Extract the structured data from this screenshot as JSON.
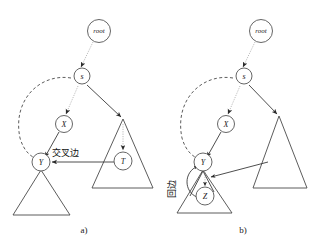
{
  "figure": {
    "background": "#ffffff",
    "panels": [
      {
        "id": "a",
        "caption": "a)",
        "nodes": [
          {
            "id": "root",
            "label": "root"
          },
          {
            "id": "s",
            "label": "s"
          },
          {
            "id": "X",
            "label": "X"
          },
          {
            "id": "Y",
            "label": "Y"
          },
          {
            "id": "T",
            "label": "T"
          }
        ],
        "annotations": [
          {
            "id": "cross-edge-label",
            "text": "交叉边",
            "meaning": "cross edge"
          }
        ],
        "edges": [
          {
            "from": "root",
            "to": "s",
            "style": "dotted"
          },
          {
            "from": "s",
            "to": "X",
            "style": "dotted"
          },
          {
            "from": "s",
            "to": "T-triangle",
            "style": "solid"
          },
          {
            "from": "X",
            "to": "Y",
            "style": "solid"
          },
          {
            "from": "s",
            "to": "Y",
            "style": "dashed"
          },
          {
            "from": "T",
            "to": "Y",
            "style": "solid"
          },
          {
            "from": "T-triangle-apex",
            "to": "T",
            "style": "dotted"
          }
        ]
      },
      {
        "id": "b",
        "caption": "b)",
        "nodes": [
          {
            "id": "root",
            "label": "root"
          },
          {
            "id": "s",
            "label": "s"
          },
          {
            "id": "X",
            "label": "X"
          },
          {
            "id": "Y",
            "label": "Y"
          },
          {
            "id": "Z",
            "label": "Z"
          }
        ],
        "annotations": [
          {
            "id": "back-edge-label",
            "text": "回边",
            "meaning": "back edge"
          }
        ],
        "edges": [
          {
            "from": "root",
            "to": "s",
            "style": "dotted"
          },
          {
            "from": "s",
            "to": "X",
            "style": "dotted"
          },
          {
            "from": "s",
            "to": "right-triangle",
            "style": "solid"
          },
          {
            "from": "X",
            "to": "Y",
            "style": "solid"
          },
          {
            "from": "s",
            "to": "Y",
            "style": "dashed"
          },
          {
            "from": "Y",
            "to": "Z",
            "style": "dotted"
          },
          {
            "from": "Z",
            "to": "Y",
            "style": "solid"
          },
          {
            "from": "right-triangle",
            "to": "Y-subtree",
            "style": "solid"
          }
        ]
      }
    ],
    "colors": {
      "tree_edge": "#3a3a3a",
      "discovery_edge": "#b4b4b4",
      "dashed_edge": "#4a4a4a",
      "triangle": "#4a4a4a",
      "node_stroke": "#555555",
      "node_fill": "#ffffff",
      "text": "#111111"
    }
  }
}
